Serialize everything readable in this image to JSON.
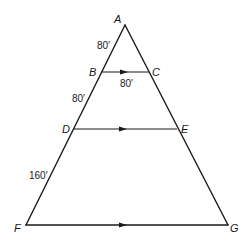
{
  "diagram": {
    "type": "similar-triangles",
    "points": {
      "A": {
        "label": "A",
        "x": 125,
        "y": 25
      },
      "B": {
        "label": "B",
        "x": 101,
        "y": 72
      },
      "C": {
        "label": "C",
        "x": 149,
        "y": 72
      },
      "D": {
        "label": "D",
        "x": 73,
        "y": 129
      },
      "E": {
        "label": "E",
        "x": 177,
        "y": 129
      },
      "F": {
        "label": "F",
        "x": 26,
        "y": 225
      },
      "G": {
        "label": "G",
        "x": 228,
        "y": 225
      }
    },
    "measurements": {
      "AB": "80′",
      "BC": "80′",
      "BD": "80′",
      "DF": "160′"
    },
    "parallel_segments": [
      "BC",
      "DE",
      "FG"
    ],
    "line_color": "#1a1a1a",
    "background": "#ffffff"
  }
}
